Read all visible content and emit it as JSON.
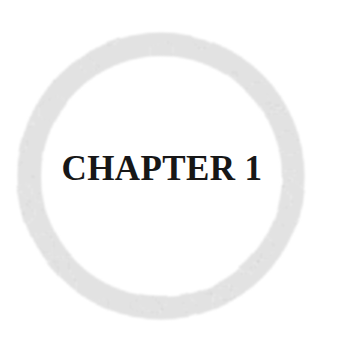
{
  "page": {
    "name": "chapter-opener",
    "width": 339,
    "height": 344,
    "background_color": "#ffffff"
  },
  "ornament": {
    "name": "ring-ornament",
    "shape": "circle-outline",
    "texture": "halftone-dither",
    "center_x": 161,
    "center_y": 176,
    "outer_radius": 144,
    "band_thickness": 23,
    "fill_color": "#d5d5d5",
    "halftone_dot_color": "#bdbdbd",
    "edge_softness": "soft"
  },
  "heading": {
    "name": "chapter-heading",
    "text": "CHAPTER 1",
    "word": "CHAPTER",
    "number": "1",
    "color": "#171717",
    "font_size_px": 35,
    "weight": "bold",
    "style": "serif",
    "cap_height_px": 25,
    "baseline_y": 190,
    "center_x": 162,
    "center_y": 177
  }
}
